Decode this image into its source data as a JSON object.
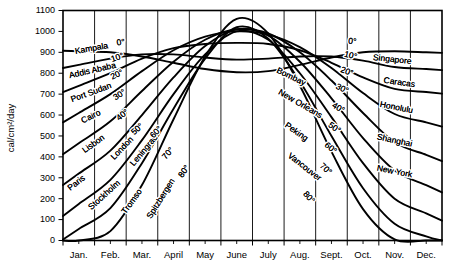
{
  "chart_data": {
    "type": "line",
    "title": "",
    "xlabel": "",
    "ylabel": "cal/cm2/day",
    "ylabel_display": "cal/cm²/day",
    "ylim": [
      0,
      1100
    ],
    "ytick_values": [
      0,
      100,
      200,
      300,
      400,
      500,
      600,
      700,
      800,
      900,
      1000,
      1100
    ],
    "ytick_labels": [
      "0",
      "100",
      "200",
      "300",
      "400",
      "500",
      "600",
      "700",
      "800",
      "900",
      "1000",
      "1100"
    ],
    "grid": true,
    "legend_position": "inline-curve-labels",
    "categories": [
      "Jan.",
      "Feb.",
      "Mar.",
      "April",
      "May",
      "June",
      "July",
      "Aug.",
      "Sept.",
      "Oct.",
      "Nov.",
      "Dec."
    ],
    "x": [
      0.5,
      1.5,
      2.5,
      3.5,
      4.5,
      5.5,
      6.5,
      7.5,
      8.5,
      9.5,
      10.5,
      11.5
    ],
    "series": [
      {
        "name": "0°",
        "latitude_label": "0°",
        "city_left": "Kampala",
        "city_right": "Singapore",
        "values": [
          905,
          900,
          880,
          850,
          820,
          805,
          810,
          840,
          875,
          900,
          905,
          900
        ]
      },
      {
        "name": "10°",
        "latitude_label": "10°",
        "city_left": "Addis Ababa",
        "city_right": "Caracas",
        "values": [
          840,
          870,
          890,
          890,
          875,
          865,
          870,
          880,
          880,
          860,
          830,
          820
        ]
      },
      {
        "name": "20°",
        "latitude_label": "20°",
        "city_left": "Port Sudan",
        "city_right": "Honolulu",
        "values": [
          740,
          800,
          870,
          920,
          940,
          945,
          940,
          910,
          850,
          780,
          725,
          710
        ]
      },
      {
        "name": "30°",
        "latitude_label": "30°",
        "city_left": "Cairo",
        "city_right": "Bombay",
        "values": [
          610,
          700,
          810,
          910,
          975,
          1000,
          985,
          925,
          825,
          705,
          605,
          565
        ]
      },
      {
        "name": "40°",
        "latitude_label": "40°",
        "city_left": "Lisbon",
        "city_right": "New Orleans",
        "values": [
          465,
          570,
          715,
          855,
          960,
          1010,
          990,
          900,
          765,
          610,
          470,
          410
        ]
      },
      {
        "name": "50°",
        "latitude_label": "50°",
        "city_left": "London",
        "city_right": "Peking",
        "values": [
          320,
          430,
          600,
          780,
          930,
          1010,
          980,
          855,
          680,
          490,
          335,
          265
        ]
      },
      {
        "name": "60°",
        "latitude_label": "60°",
        "city_left": "Leningrad",
        "city_right": "Shanghai",
        "values": [
          175,
          290,
          480,
          700,
          890,
          1000,
          960,
          800,
          590,
          370,
          200,
          130
        ]
      },
      {
        "name": "70°",
        "latitude_label": "70°",
        "city_left": "Tromso",
        "city_right": "Vancouver",
        "values": [
          55,
          155,
          370,
          630,
          870,
          1020,
          965,
          760,
          500,
          250,
          80,
          20
        ]
      },
      {
        "name": "80°",
        "latitude_label": "80°",
        "city_left": "Spitzbergen",
        "city_right": "New York",
        "values": [
          0,
          45,
          265,
          580,
          880,
          1060,
          990,
          740,
          425,
          150,
          5,
          0
        ]
      }
    ],
    "left_curve_labels": [
      "Kampala",
      "Addis Ababa",
      "Port Sudan",
      "Cairo",
      "Lisbon",
      "Paris",
      "London",
      "Stockholm",
      "Leningrad",
      "Tromso",
      "Spitzbergen"
    ],
    "right_curve_labels": [
      "Singapore",
      "Caracas",
      "Honolulu",
      "Shanghai",
      "New York",
      "Bombay",
      "New Orleans",
      "Peking",
      "Vancouver"
    ],
    "latitude_labels_left": [
      "0°",
      "10°",
      "20°",
      "30°",
      "40°",
      "50°",
      "60°",
      "70°",
      "80°"
    ],
    "latitude_labels_right": [
      "0°",
      "10°",
      "20°",
      "30°",
      "40°",
      "50°",
      "60°",
      "70°",
      "80°"
    ],
    "colors": {
      "line": "#000000",
      "grid": "#000000",
      "background": "#ffffff"
    }
  },
  "annotations": {
    "left": [
      {
        "text": "Kampala",
        "x": 92,
        "y": 51,
        "rot": -10
      },
      {
        "text": "Addis Ababa",
        "x": 93,
        "y": 73,
        "rot": -13
      },
      {
        "text": "Port Sudan",
        "x": 92,
        "y": 95,
        "rot": -20
      },
      {
        "text": "Cairo",
        "x": 92,
        "y": 119,
        "rot": -26
      },
      {
        "text": "Lisbon",
        "x": 95,
        "y": 146,
        "rot": -36
      },
      {
        "text": "Paris",
        "x": 78,
        "y": 185,
        "rot": -38
      },
      {
        "text": "London",
        "x": 124,
        "y": 150,
        "rot": -46
      },
      {
        "text": "Stockholm",
        "x": 106,
        "y": 197,
        "rot": -42
      },
      {
        "text": "Leningrad",
        "x": 146,
        "y": 152,
        "rot": -50
      },
      {
        "text": "Tromso",
        "x": 134,
        "y": 203,
        "rot": -54
      },
      {
        "text": "Spitzbergen",
        "x": 163,
        "y": 200,
        "rot": -58
      }
    ],
    "left_lat": [
      {
        "text": "0°",
        "x": 121,
        "y": 45,
        "rot": -8
      },
      {
        "text": "10°",
        "x": 118,
        "y": 60,
        "rot": -18
      },
      {
        "text": "20°",
        "x": 118,
        "y": 77,
        "rot": -26
      },
      {
        "text": "30°",
        "x": 121,
        "y": 97,
        "rot": -33
      },
      {
        "text": "40°",
        "x": 124,
        "y": 117,
        "rot": -38
      },
      {
        "text": "50°",
        "x": 139,
        "y": 131,
        "rot": -42
      },
      {
        "text": "60°",
        "x": 158,
        "y": 134,
        "rot": -46
      },
      {
        "text": "70°",
        "x": 170,
        "y": 155,
        "rot": -50
      },
      {
        "text": "80°",
        "x": 186,
        "y": 173,
        "rot": -53
      }
    ],
    "right_lat": [
      {
        "text": "0°",
        "x": 352,
        "y": 44,
        "rot": 6
      },
      {
        "text": "10°",
        "x": 350,
        "y": 58,
        "rot": 14
      },
      {
        "text": "20°",
        "x": 346,
        "y": 74,
        "rot": 20
      },
      {
        "text": "30°",
        "x": 341,
        "y": 91,
        "rot": 26
      },
      {
        "text": "40°",
        "x": 337,
        "y": 110,
        "rot": 31
      },
      {
        "text": "50°",
        "x": 333,
        "y": 130,
        "rot": 35
      },
      {
        "text": "60°",
        "x": 329,
        "y": 150,
        "rot": 39
      },
      {
        "text": "70°",
        "x": 324,
        "y": 171,
        "rot": 43
      },
      {
        "text": "80°",
        "x": 307,
        "y": 199,
        "rot": 48
      }
    ],
    "right": [
      {
        "text": "Singapore",
        "x": 392,
        "y": 62,
        "rot": 6
      },
      {
        "text": "Caracas",
        "x": 399,
        "y": 85,
        "rot": 8
      },
      {
        "text": "Honolulu",
        "x": 396,
        "y": 110,
        "rot": 11
      },
      {
        "text": "Shanghai",
        "x": 394,
        "y": 143,
        "rot": 12
      },
      {
        "text": "New York",
        "x": 394,
        "y": 174,
        "rot": 11
      },
      {
        "text": "Bombay",
        "x": 290,
        "y": 79,
        "rot": 26
      },
      {
        "text": "New Orleans",
        "x": 299,
        "y": 106,
        "rot": 30
      },
      {
        "text": "Peking",
        "x": 295,
        "y": 134,
        "rot": 35
      },
      {
        "text": "Vancouver",
        "x": 303,
        "y": 169,
        "rot": 38
      }
    ]
  },
  "axes": {
    "y_unit_label": "cal/cm²/day",
    "months": [
      "Jan.",
      "Feb.",
      "Mar.",
      "April",
      "May",
      "June",
      "July",
      "Aug.",
      "Sept.",
      "Oct.",
      "Nov.",
      "Dec."
    ],
    "y_ticks": [
      "1100",
      "1000",
      "900",
      "800",
      "700",
      "600",
      "500",
      "400",
      "300",
      "200",
      "100",
      "0"
    ]
  }
}
